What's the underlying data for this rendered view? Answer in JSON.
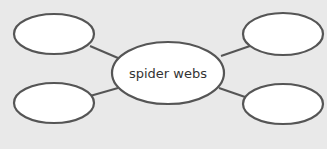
{
  "diagram": {
    "type": "web-graphic-organizer",
    "center": {
      "label": "spider webs"
    },
    "nodes": [
      {
        "position": "top-left",
        "label": ""
      },
      {
        "position": "top-right",
        "label": ""
      },
      {
        "position": "bottom-left",
        "label": ""
      },
      {
        "position": "bottom-right",
        "label": ""
      }
    ],
    "colors": {
      "background": "#e9e9e9",
      "node_fill": "#ffffff",
      "stroke": "#555555",
      "text": "#333333"
    }
  }
}
